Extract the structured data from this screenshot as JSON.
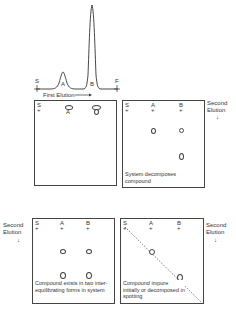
{
  "chromatogram": {
    "start_label": "S",
    "finish_label": "F",
    "peak_a_label": "A",
    "peak_b_label": "B",
    "axis_label": "First Elution"
  },
  "panels": [
    {
      "id": "top-left",
      "origin_label": "S",
      "spot_labels": [
        "A",
        "B"
      ],
      "caption": ""
    },
    {
      "id": "top-right",
      "origin_label": "S",
      "lane_labels": [
        "A",
        "B"
      ],
      "caption": "System decomposes compound",
      "side_label": "Second Elution"
    },
    {
      "id": "bottom-left",
      "origin_label": "S",
      "lane_labels": [
        "A",
        "B"
      ],
      "caption": "Compound exists in two inter-equilibrating forms in system",
      "side_label": "Second Elution"
    },
    {
      "id": "bottom-right",
      "origin_label": "S",
      "lane_labels": [
        "A",
        "B"
      ],
      "caption": "Compound impure initially or decomposed in spotting",
      "side_label": "Second Elution"
    }
  ]
}
